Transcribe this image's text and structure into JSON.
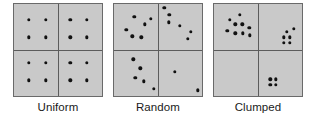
{
  "figure": {
    "background_color": "#ffffff",
    "panel_fill_color": "#c9c9c9",
    "panel_border_color": "#6a6a6a",
    "divider_color": "#5c5c5c",
    "dot_color": "#111111"
  },
  "chart_data": {
    "type": "scatter",
    "title": "",
    "xlabel": "",
    "ylabel": "",
    "xlim": [
      0,
      100
    ],
    "ylim": [
      0,
      100
    ],
    "grid": false,
    "legend": null,
    "panels": [
      {
        "label": "Uniform",
        "left_px": 13,
        "dot_count": 16,
        "quadrant_counts": {
          "top_left": 4,
          "top_right": 4,
          "bottom_left": 4,
          "bottom_right": 4
        },
        "points": [
          [
            17,
            83
          ],
          [
            36,
            83
          ],
          [
            17,
            64
          ],
          [
            36,
            64
          ],
          [
            64,
            83
          ],
          [
            83,
            83
          ],
          [
            64,
            64
          ],
          [
            83,
            64
          ],
          [
            17,
            36
          ],
          [
            36,
            36
          ],
          [
            17,
            17
          ],
          [
            36,
            17
          ],
          [
            64,
            36
          ],
          [
            83,
            36
          ],
          [
            64,
            17
          ],
          [
            83,
            17
          ]
        ]
      },
      {
        "label": "Random",
        "left_px": 113,
        "dot_count": 19,
        "quadrant_counts": {
          "top_left": 6,
          "top_right": 6,
          "bottom_left": 5,
          "bottom_right": 2
        },
        "points": [
          [
            23,
            86
          ],
          [
            35,
            78
          ],
          [
            14,
            72
          ],
          [
            21,
            65
          ],
          [
            31,
            64
          ],
          [
            42,
            84
          ],
          [
            57,
            96
          ],
          [
            63,
            88
          ],
          [
            62,
            80
          ],
          [
            75,
            76
          ],
          [
            87,
            70
          ],
          [
            84,
            62
          ],
          [
            22,
            40
          ],
          [
            30,
            30
          ],
          [
            24,
            20
          ],
          [
            34,
            16
          ],
          [
            45,
            8
          ],
          [
            69,
            26
          ],
          [
            95,
            6
          ]
        ]
      },
      {
        "label": "Clumped",
        "left_px": 213,
        "dot_count": 19,
        "quadrant_counts": {
          "top_left": 9,
          "top_right": 6,
          "bottom_left": 0,
          "bottom_right": 4
        },
        "points": [
          [
            18,
            83
          ],
          [
            29,
            88
          ],
          [
            24,
            78
          ],
          [
            32,
            78
          ],
          [
            15,
            71
          ],
          [
            40,
            74
          ],
          [
            24,
            68
          ],
          [
            33,
            68
          ],
          [
            41,
            66
          ],
          [
            83,
            70
          ],
          [
            91,
            73
          ],
          [
            79,
            64
          ],
          [
            86,
            64
          ],
          [
            79,
            58
          ],
          [
            86,
            58
          ],
          [
            64,
            18
          ],
          [
            70,
            18
          ],
          [
            64,
            12
          ],
          [
            70,
            12
          ]
        ]
      }
    ]
  }
}
